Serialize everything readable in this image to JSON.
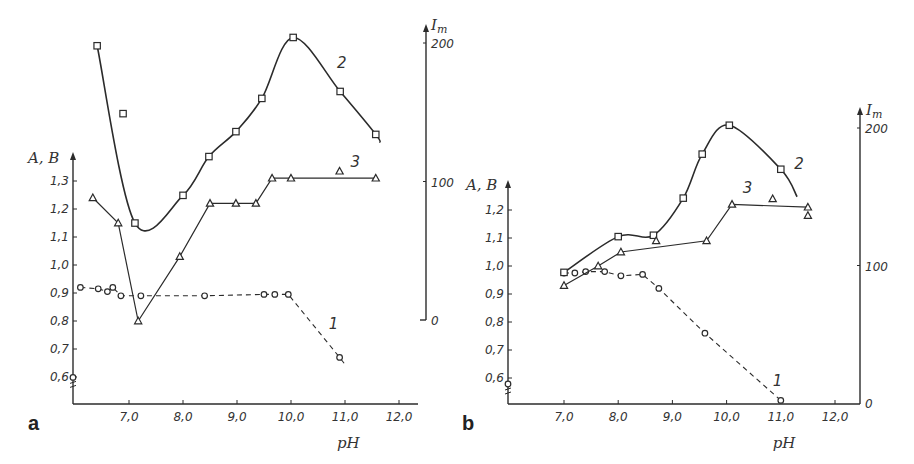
{
  "figure": {
    "panels": [
      {
        "label": "a"
      },
      {
        "label": "b"
      }
    ]
  },
  "chart_data": [
    {
      "type": "line",
      "panel": "a",
      "xlabel": "pH",
      "ylabel_left": "A, B",
      "ylabel_right": "Im",
      "x_ticks": [
        "7,0",
        "8,0",
        "9,0",
        "10,0",
        "11,0",
        "12,0"
      ],
      "x_tick_values": [
        7,
        8,
        9,
        10,
        11,
        12
      ],
      "y_left_ticks": [
        "0,6",
        "0,7",
        "0,8",
        "0,9",
        "1,0",
        "1,1",
        "1,2",
        "1,3"
      ],
      "y_left_tick_values": [
        0.6,
        0.7,
        0.8,
        0.9,
        1.0,
        1.1,
        1.2,
        1.3
      ],
      "y_right_ticks": [
        "0",
        "100",
        "200"
      ],
      "y_right_tick_values": [
        0,
        100,
        200
      ],
      "xlim": [
        6.0,
        12.4
      ],
      "ylim_left": [
        0.5,
        1.38
      ],
      "ylim_right": [
        0,
        200
      ],
      "grid": false,
      "series": [
        {
          "name": "1",
          "axis": "left",
          "style": "dashed",
          "marker": "circle",
          "x": [
            6.1,
            6.43,
            6.6,
            6.7,
            6.85,
            7.22,
            8.4,
            9.5,
            9.7,
            9.95,
            10.9
          ],
          "y": [
            0.92,
            0.915,
            0.905,
            0.92,
            0.89,
            0.89,
            0.89,
            0.895,
            0.895,
            0.895,
            0.67
          ],
          "line_end": [
            11.0,
            0.645
          ],
          "label_pos": [
            10.7,
            0.77
          ]
        },
        {
          "name": "2",
          "axis": "right",
          "style": "smooth",
          "marker": "square",
          "x": [
            6.41,
            7.11,
            8.0,
            8.48,
            8.98,
            9.46,
            10.04,
            10.91,
            11.57
          ],
          "y": [
            198,
            70,
            90,
            118,
            136,
            160,
            204,
            165,
            134
          ],
          "outliers": {
            "x": [
              6.89
            ],
            "y": [
              149
            ]
          },
          "line_end": [
            11.65,
            128
          ],
          "label_pos": [
            10.85,
            182
          ]
        },
        {
          "name": "3",
          "axis": "left",
          "style": "solid",
          "marker": "triangle",
          "x": [
            6.33,
            6.8,
            7.17,
            7.94,
            8.5,
            8.98,
            9.35,
            9.65,
            10.0,
            11.57
          ],
          "y": [
            1.24,
            1.15,
            0.8,
            1.03,
            1.22,
            1.22,
            1.22,
            1.31,
            1.31,
            1.31
          ],
          "outliers": {
            "x": [
              10.9
            ],
            "y": [
              1.335
            ]
          },
          "label_pos": [
            11.1,
            1.35
          ]
        }
      ],
      "axis_marker": {
        "x": 6.0,
        "y": 0.57
      }
    },
    {
      "type": "line",
      "panel": "b",
      "xlabel": "pH",
      "ylabel_left": "A, B",
      "ylabel_right": "Im",
      "x_ticks": [
        "7,0",
        "8,0",
        "9,0",
        "10,0",
        "11,0",
        "12,0"
      ],
      "x_tick_values": [
        7,
        8,
        9,
        10,
        11,
        12
      ],
      "y_left_ticks": [
        "0,6",
        "0,7",
        "0,8",
        "0,9",
        "1,0",
        "1,1",
        "1,2"
      ],
      "y_left_tick_values": [
        0.6,
        0.7,
        0.8,
        0.9,
        1.0,
        1.1,
        1.2
      ],
      "y_right_ticks": [
        "0",
        "100",
        "200"
      ],
      "y_right_tick_values": [
        0,
        100,
        200
      ],
      "xlim": [
        6.0,
        12.45
      ],
      "ylim_left": [
        0.5,
        1.28
      ],
      "ylim_right": [
        0,
        200
      ],
      "grid": false,
      "series": [
        {
          "name": "1",
          "axis": "left",
          "style": "dashed",
          "marker": "circle",
          "x": [
            7.0,
            7.2,
            7.4,
            7.75,
            8.05,
            8.45,
            8.75,
            9.6,
            11.0
          ],
          "y": [
            0.975,
            0.975,
            0.98,
            0.98,
            0.965,
            0.97,
            0.92,
            0.76,
            0.52
          ],
          "label_pos": [
            10.85,
            0.57
          ]
        },
        {
          "name": "2",
          "axis": "right",
          "style": "smooth",
          "marker": "square",
          "x": [
            7.0,
            8.0,
            8.65,
            9.2,
            9.55,
            10.05,
            11.0
          ],
          "y": [
            95,
            121,
            122,
            149,
            181,
            202,
            170
          ],
          "line_end": [
            11.3,
            150
          ],
          "label_pos": [
            11.25,
            170
          ]
        },
        {
          "name": "3",
          "axis": "left",
          "style": "solid",
          "marker": "triangle",
          "x": [
            7.0,
            7.63,
            8.05,
            9.63,
            10.1,
            11.5
          ],
          "y": [
            0.93,
            1.0,
            1.05,
            1.09,
            1.22,
            1.21
          ],
          "outliers": {
            "x": [
              8.7,
              10.85,
              11.5
            ],
            "y": [
              1.09,
              1.24,
              1.18
            ]
          },
          "label_pos": [
            10.3,
            1.26
          ]
        }
      ],
      "axis_marker": {
        "x": 6.0,
        "y": 0.55
      }
    }
  ]
}
